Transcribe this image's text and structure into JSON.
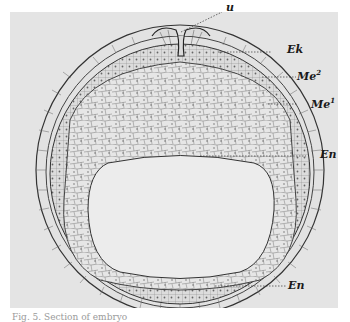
{
  "figure": {
    "labels": [
      {
        "id": "u",
        "text": "u",
        "sup": ""
      },
      {
        "id": "Ek",
        "text": "Ek",
        "sup": ""
      },
      {
        "id": "Me2",
        "text": "Me",
        "sup": "2"
      },
      {
        "id": "Me1",
        "text": "Me",
        "sup": "1"
      },
      {
        "id": "En_side",
        "text": "En",
        "sup": ""
      },
      {
        "id": "En_bottom",
        "text": "En",
        "sup": ""
      }
    ]
  },
  "caption": {
    "text": "Fig. 5. Section of embryo"
  }
}
